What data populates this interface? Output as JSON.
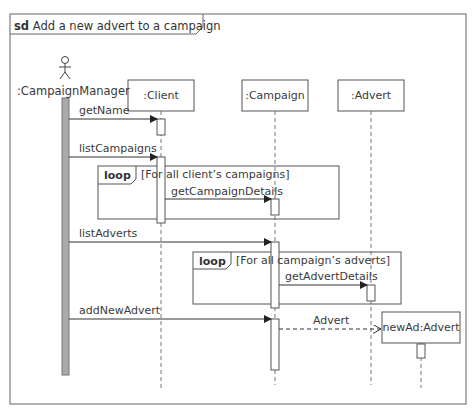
{
  "frame": {
    "keyword": "sd",
    "title": "Add a new advert to a campaign"
  },
  "actor": {
    "name": ":CampaignManager"
  },
  "lifelines": [
    {
      "name": ":Client"
    },
    {
      "name": ":Campaign"
    },
    {
      "name": ":Advert"
    },
    {
      "name": "newAd:Advert"
    }
  ],
  "messages": [
    {
      "label": "getName",
      "from": ":CampaignManager",
      "to": ":Client",
      "type": "synchronous"
    },
    {
      "label": "listCampaigns",
      "from": ":CampaignManager",
      "to": ":Client",
      "type": "synchronous"
    },
    {
      "label": "getCampaignDetails",
      "from": ":Client",
      "to": ":Campaign",
      "type": "synchronous"
    },
    {
      "label": "listAdverts",
      "from": ":CampaignManager",
      "to": ":Campaign",
      "type": "synchronous"
    },
    {
      "label": "getAdvertDetails",
      "from": ":Campaign",
      "to": ":Advert",
      "type": "synchronous"
    },
    {
      "label": "addNewAdvert",
      "from": ":CampaignManager",
      "to": ":Campaign",
      "type": "synchronous"
    },
    {
      "label": "Advert",
      "from": ":Campaign",
      "to": "newAd:Advert",
      "type": "create"
    }
  ],
  "fragments": [
    {
      "operator": "loop",
      "guard": "[For all client’s campaigns]"
    },
    {
      "operator": "loop",
      "guard": "[For all campaign’s adverts]"
    }
  ],
  "colors": {
    "line": "#555555",
    "actor_bar": "#a9a9a9",
    "background": "#ffffff"
  }
}
